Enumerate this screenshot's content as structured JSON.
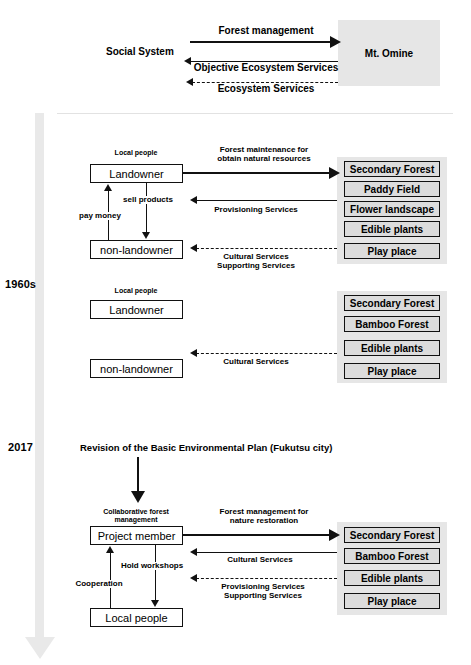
{
  "figure": {
    "title_present": false,
    "timeline": {
      "years": [
        {
          "id": "year-1960s",
          "label": "1960s"
        },
        {
          "id": "year-2017",
          "label": "2017"
        }
      ],
      "arrow_direction": "down",
      "color": "#e9e9e9"
    },
    "colors": {
      "line": "#111111",
      "eco_panel_bg": "#e6e6e6",
      "eco_box_bg": "#dcdcdc",
      "node_box_bg": "#ffffff",
      "divider": "#e2e2e2"
    }
  },
  "conceptual": {
    "actor": "Social System",
    "target": "Mt. Omine",
    "flows": [
      {
        "label": "Forest management",
        "dir": "right",
        "style": "solid-thick"
      },
      {
        "label": "Objective Ecosystem Services",
        "dir": "left",
        "style": "solid"
      },
      {
        "label": "Ecosystem Services",
        "dir": "left",
        "style": "dashed"
      }
    ]
  },
  "period_1960s_a": {
    "group_label": "Local people",
    "nodes": [
      {
        "id": "landowner",
        "label": "Landowner"
      },
      {
        "id": "non-landowner",
        "label": "non-landowner"
      }
    ],
    "internal_flows": [
      {
        "label": "sell products",
        "dir": "down"
      },
      {
        "label": "pay money",
        "dir": "up"
      }
    ],
    "flows": [
      {
        "label": "Forest maintenance for obtain natural resources",
        "dir": "right",
        "style": "solid-thick"
      },
      {
        "label": "Provisioning Services",
        "dir": "left",
        "style": "solid"
      },
      {
        "label": "Cultural Services Supporting Services",
        "dir": "left",
        "style": "dashed"
      }
    ],
    "ecosystem": [
      "Secondary Forest",
      "Paddy Field",
      "Flower landscape",
      "Edible plants",
      "Play place"
    ]
  },
  "period_1960s_b": {
    "group_label": "Local people",
    "nodes": [
      {
        "id": "landowner",
        "label": "Landowner"
      },
      {
        "id": "non-landowner",
        "label": "non-landowner"
      }
    ],
    "flows": [
      {
        "label": "Cultural Services",
        "dir": "left",
        "style": "dashed"
      }
    ],
    "ecosystem": [
      "Secondary Forest",
      "Bamboo Forest",
      "Edible plants",
      "Play place"
    ]
  },
  "period_2017": {
    "event": "Revision of the Basic Environmental Plan (Fukutsu city)",
    "group_label": "Collaborative forest management",
    "nodes": [
      {
        "id": "project-member",
        "label": "Project member"
      },
      {
        "id": "local-people",
        "label": "Local people"
      }
    ],
    "internal_flows": [
      {
        "label": "Hold workshops",
        "dir": "down"
      },
      {
        "label": "Cooperation",
        "dir": "up"
      }
    ],
    "flows": [
      {
        "label": "Forest management for nature restoration",
        "dir": "right",
        "style": "solid-thick"
      },
      {
        "label": "Cultural Services",
        "dir": "left",
        "style": "solid"
      },
      {
        "label": "Provisioning Services Supporting Services",
        "dir": "left",
        "style": "dashed"
      }
    ],
    "ecosystem": [
      "Secondary Forest",
      "Bamboo Forest",
      "Edible plants",
      "Play place"
    ]
  },
  "flow_labels": {
    "forest_management": "Forest management",
    "objective_ecosystem_services": "Objective Ecosystem Services",
    "ecosystem_services": "Ecosystem Services",
    "forest_maintenance_l1": "Forest maintenance for",
    "forest_maintenance_l2": "obtain natural resources",
    "provisioning_services": "Provisioning Services",
    "cultural_services": "Cultural Services",
    "cultural_services_l1": "Cultural Services",
    "supporting_services_l2": "Supporting Services",
    "provisioning_services_l1": "Provisioning Services",
    "supporting_services_l2b": "Supporting Services",
    "sell_products": "sell products",
    "pay_money": "pay money",
    "hold_workshops": "Hold workshops",
    "cooperation": "Cooperation",
    "forest_mgmt_nature_l1": "Forest management for",
    "forest_mgmt_nature_l2": "nature restoration",
    "collab_forest_l1": "Collaborative forest",
    "collab_forest_l2": "management"
  }
}
